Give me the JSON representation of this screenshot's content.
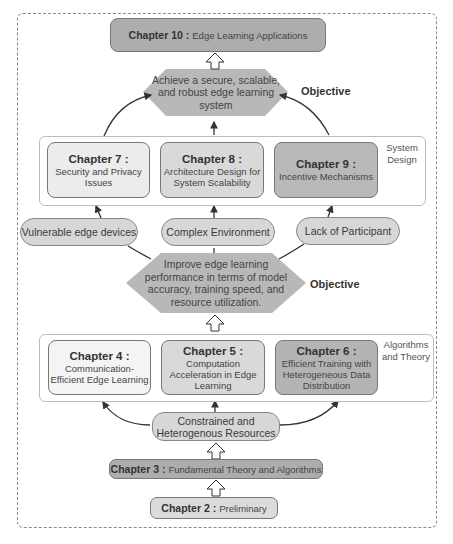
{
  "diagram": {
    "top_chapter": {
      "number": "Chapter 10 :",
      "title": "Edge Learning Applications"
    },
    "objective_top": {
      "text": "Achieve a secure, scalable, and robust edge learning system",
      "label": "Objective"
    },
    "system_design": {
      "label": "System Design",
      "chapters": [
        {
          "number": "Chapter 7 :",
          "title": "Security and Privacy Issues",
          "color": "#ececec"
        },
        {
          "number": "Chapter 8 :",
          "title": "Architecture Design for System Scalability",
          "color": "#d9d9d9"
        },
        {
          "number": "Chapter 9 :",
          "title": "Incentive Mechanisms",
          "color": "#b9b9b9"
        }
      ]
    },
    "challenges_top": [
      "Vulnerable edge devices",
      "Complex Environment",
      "Lack of Participant"
    ],
    "objective_mid": {
      "text": "Improve edge learning performance in terms of model accuracy, training speed, and resource utilization.",
      "label": "Objective"
    },
    "algorithms_theory": {
      "label": "Algorithms and Theory",
      "chapters": [
        {
          "number": "Chapter 4 :",
          "title": "Communication-Efficient Edge Learning",
          "color": "#f4f4f4"
        },
        {
          "number": "Chapter 5 :",
          "title": "Computation Acceleration in Edge Learning",
          "color": "#d9d9d9"
        },
        {
          "number": "Chapter 6 :",
          "title": "Efficient Training with Heterogeneous Data Distribution",
          "color": "#b4b4b4"
        }
      ]
    },
    "challenge_bottom": "Constrained and Heterogenous Resources",
    "chapter3": {
      "number": "Chapter 3 :",
      "title": "Fundamental Theory and Algorithms"
    },
    "chapter2": {
      "number": "Chapter 2 :",
      "title": "Preliminary"
    },
    "colors": {
      "dark_box": "#adadad",
      "hex": "#b8b8b8",
      "pill": "#d7d7d7"
    }
  }
}
